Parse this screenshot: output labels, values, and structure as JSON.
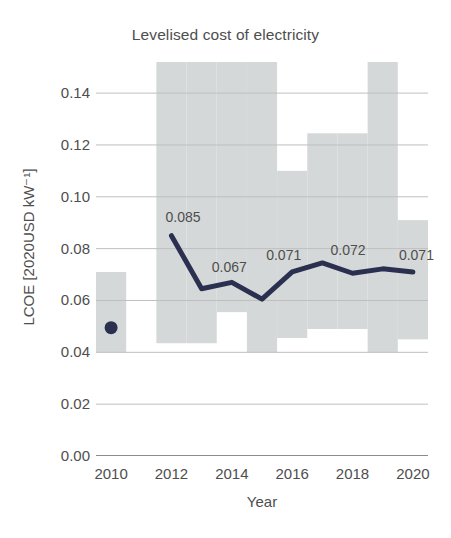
{
  "chart_data": {
    "type": "line",
    "title": "Levelised cost of electricity",
    "xlabel": "Year",
    "ylabel": "LCOE [2020USD kW⁻¹]",
    "xlim": [
      2009.5,
      2020.5
    ],
    "ylim": [
      0.0,
      0.152
    ],
    "grid": true,
    "legend": false,
    "xticks": [
      "2010",
      "2012",
      "2014",
      "2016",
      "2018",
      "2020"
    ],
    "xtick_values": [
      2010,
      2012,
      2014,
      2016,
      2018,
      2020
    ],
    "yticks": [
      "0.00",
      "0.02",
      "0.04",
      "0.06",
      "0.08",
      "0.10",
      "0.12",
      "0.14"
    ],
    "ytick_values": [
      0.0,
      0.02,
      0.04,
      0.06,
      0.08,
      0.1,
      0.12,
      0.14
    ],
    "x": [
      2010,
      2012,
      2013,
      2014,
      2015,
      2016,
      2017,
      2018,
      2019,
      2020
    ],
    "values": [
      0.0495,
      0.085,
      0.0645,
      0.067,
      0.0605,
      0.071,
      0.0745,
      0.0705,
      0.0722,
      0.071
    ],
    "marker_points": [
      {
        "x": 2010,
        "y": 0.0495
      }
    ],
    "line_points": [
      {
        "x": 2012,
        "y": 0.085
      },
      {
        "x": 2013,
        "y": 0.0645
      },
      {
        "x": 2014,
        "y": 0.067
      },
      {
        "x": 2015,
        "y": 0.0605
      },
      {
        "x": 2016,
        "y": 0.071
      },
      {
        "x": 2017,
        "y": 0.0745
      },
      {
        "x": 2018,
        "y": 0.0705
      },
      {
        "x": 2019,
        "y": 0.0722
      },
      {
        "x": 2020,
        "y": 0.071
      }
    ],
    "annotations": [
      {
        "text": "0.085",
        "x": 2012,
        "y": 0.085
      },
      {
        "text": "0.067",
        "x": 2014,
        "y": 0.067
      },
      {
        "text": "0.071",
        "x": 2016,
        "y": 0.071
      },
      {
        "text": "0.072",
        "x": 2018,
        "y": 0.0722
      },
      {
        "text": "0.071",
        "x": 2020,
        "y": 0.071
      }
    ],
    "band_label": "range",
    "band": [
      {
        "year": 2010,
        "low": 0.04,
        "high": 0.071
      },
      {
        "year": 2012,
        "low": 0.0435,
        "high": 0.152
      },
      {
        "year": 2013,
        "low": 0.0435,
        "high": 0.152
      },
      {
        "year": 2014,
        "low": 0.0555,
        "high": 0.152
      },
      {
        "year": 2015,
        "low": 0.04,
        "high": 0.152
      },
      {
        "year": 2016,
        "low": 0.0455,
        "high": 0.11
      },
      {
        "year": 2017,
        "low": 0.049,
        "high": 0.1245
      },
      {
        "year": 2018,
        "low": 0.049,
        "high": 0.1245
      },
      {
        "year": 2019,
        "low": 0.04,
        "high": 0.152
      },
      {
        "year": 2020,
        "low": 0.045,
        "high": 0.091
      }
    ],
    "colors": {
      "line": "#2b3050",
      "marker": "#2b3050",
      "band": "#d5d8d8",
      "grid": "#bfbfbf",
      "axis": "#8b8b8b",
      "text": "#4e4e4e",
      "background": "#ffffff"
    }
  }
}
